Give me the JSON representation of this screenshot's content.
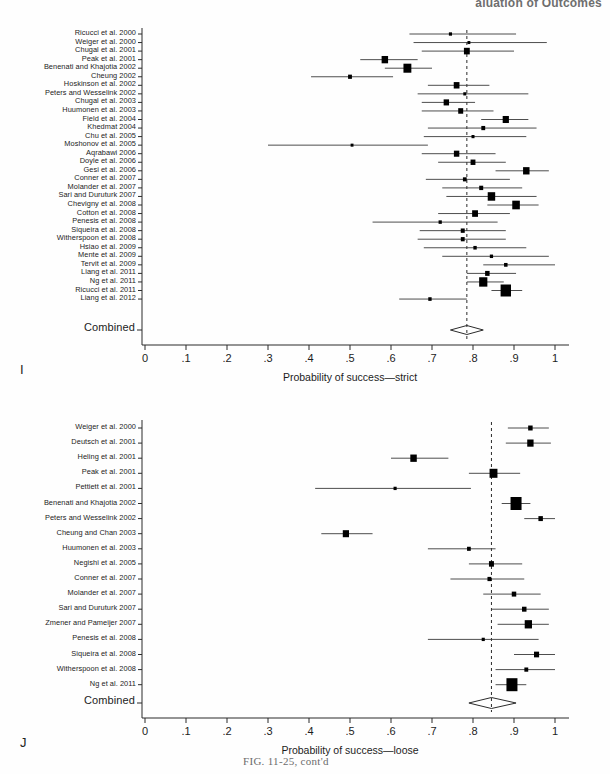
{
  "page": {
    "running_head": "aluation of Outcomes",
    "figure_caption": "FIG. 11-25, cont'd",
    "panel_I_letter": "I",
    "panel_J_letter": "J"
  },
  "axis": {
    "tick_labels": [
      "0",
      ".1",
      ".2",
      ".3",
      ".4",
      ".5",
      ".6",
      ".7",
      ".8",
      ".9",
      "1"
    ],
    "tick_values": [
      0,
      0.1,
      0.2,
      0.3,
      0.4,
      0.5,
      0.6,
      0.7,
      0.8,
      0.9,
      1.0
    ],
    "combined_row_label": "Combined"
  },
  "chart_data": [
    {
      "type": "forest",
      "panel": "I",
      "title": "",
      "xlabel": "Probability of success—strict",
      "ylabel": "",
      "xlim": [
        0,
        1
      ],
      "xticks": [
        0,
        0.1,
        0.2,
        0.3,
        0.4,
        0.5,
        0.6,
        0.7,
        0.8,
        0.9,
        1.0
      ],
      "xticklabels": [
        "0",
        ".1",
        ".2",
        ".3",
        ".4",
        ".5",
        ".6",
        ".7",
        ".8",
        ".9",
        "1"
      ],
      "grid": false,
      "reference_line": 0.785,
      "combined": {
        "label": "Combined",
        "estimate": 0.785,
        "ci_low": 0.745,
        "ci_high": 0.825
      },
      "studies": [
        {
          "label": "Ricucci et al. 2000",
          "estimate": 0.745,
          "ci_low": 0.645,
          "ci_high": 0.905,
          "weight": 0.18
        },
        {
          "label": "Weiger et al. 2000",
          "estimate": 0.79,
          "ci_low": 0.655,
          "ci_high": 0.98,
          "weight": 0.14
        },
        {
          "label": "Chugal et al. 2001",
          "estimate": 0.785,
          "ci_low": 0.675,
          "ci_high": 0.9,
          "weight": 0.62
        },
        {
          "label": "Peak et al. 2001",
          "estimate": 0.585,
          "ci_low": 0.525,
          "ci_high": 0.665,
          "weight": 0.72
        },
        {
          "label": "Benenati and Khajotia 2002",
          "estimate": 0.64,
          "ci_low": 0.585,
          "ci_high": 0.7,
          "weight": 0.95
        },
        {
          "label": "Cheung 2002",
          "estimate": 0.5,
          "ci_low": 0.405,
          "ci_high": 0.605,
          "weight": 0.3
        },
        {
          "label": "Hoskinson et al. 2002",
          "estimate": 0.76,
          "ci_low": 0.69,
          "ci_high": 0.84,
          "weight": 0.6
        },
        {
          "label": "Peters and Wesselink 2002",
          "estimate": 0.78,
          "ci_low": 0.665,
          "ci_high": 0.935,
          "weight": 0.16
        },
        {
          "label": "Chugal et al. 2003",
          "estimate": 0.735,
          "ci_low": 0.675,
          "ci_high": 0.805,
          "weight": 0.55
        },
        {
          "label": "Huumonen et al. 2003",
          "estimate": 0.77,
          "ci_low": 0.675,
          "ci_high": 0.85,
          "weight": 0.48
        },
        {
          "label": "Field et al. 2004",
          "estimate": 0.88,
          "ci_low": 0.82,
          "ci_high": 0.935,
          "weight": 0.68
        },
        {
          "label": "Khedmat 2004",
          "estimate": 0.825,
          "ci_low": 0.69,
          "ci_high": 0.955,
          "weight": 0.3
        },
        {
          "label": "Chu et al. 2005",
          "estimate": 0.8,
          "ci_low": 0.68,
          "ci_high": 0.93,
          "weight": 0.16
        },
        {
          "label": "Moshonov et al. 2005",
          "estimate": 0.505,
          "ci_low": 0.3,
          "ci_high": 0.69,
          "weight": 0.14
        },
        {
          "label": "Aqrabawi 2006",
          "estimate": 0.76,
          "ci_low": 0.675,
          "ci_high": 0.855,
          "weight": 0.55
        },
        {
          "label": "Doyle et al. 2006",
          "estimate": 0.8,
          "ci_low": 0.715,
          "ci_high": 0.88,
          "weight": 0.46
        },
        {
          "label": "Gesi et al. 2006",
          "estimate": 0.93,
          "ci_low": 0.855,
          "ci_high": 0.985,
          "weight": 0.72
        },
        {
          "label": "Conner et al. 2007",
          "estimate": 0.78,
          "ci_low": 0.685,
          "ci_high": 0.89,
          "weight": 0.28
        },
        {
          "label": "Molander et al. 2007",
          "estimate": 0.82,
          "ci_low": 0.725,
          "ci_high": 0.92,
          "weight": 0.32
        },
        {
          "label": "Sari and Duruturk 2007",
          "estimate": 0.845,
          "ci_low": 0.735,
          "ci_high": 0.955,
          "weight": 0.88
        },
        {
          "label": "Chevigny et al. 2008",
          "estimate": 0.905,
          "ci_low": 0.835,
          "ci_high": 0.96,
          "weight": 0.9
        },
        {
          "label": "Cotton et al. 2008",
          "estimate": 0.805,
          "ci_low": 0.715,
          "ci_high": 0.89,
          "weight": 0.62
        },
        {
          "label": "Penesis et al. 2008",
          "estimate": 0.72,
          "ci_low": 0.555,
          "ci_high": 0.86,
          "weight": 0.2
        },
        {
          "label": "Siqueira et al. 2008",
          "estimate": 0.775,
          "ci_low": 0.67,
          "ci_high": 0.88,
          "weight": 0.32
        },
        {
          "label": "Witherspoon et al. 2008",
          "estimate": 0.775,
          "ci_low": 0.665,
          "ci_high": 0.88,
          "weight": 0.3
        },
        {
          "label": "Hsiao et al. 2009",
          "estimate": 0.805,
          "ci_low": 0.68,
          "ci_high": 0.93,
          "weight": 0.22
        },
        {
          "label": "Mente et al. 2009",
          "estimate": 0.845,
          "ci_low": 0.725,
          "ci_high": 0.985,
          "weight": 0.2
        },
        {
          "label": "Tervit et al. 2009",
          "estimate": 0.88,
          "ci_low": 0.825,
          "ci_high": 1.0,
          "weight": 0.24
        },
        {
          "label": "Liang et al. 2011",
          "estimate": 0.835,
          "ci_low": 0.785,
          "ci_high": 0.905,
          "weight": 0.4
        },
        {
          "label": "Ng et al. 2011",
          "estimate": 0.825,
          "ci_low": 0.785,
          "ci_high": 0.875,
          "weight": 1.0
        },
        {
          "label": "Ricucci et al. 2011",
          "estimate": 0.88,
          "ci_low": 0.845,
          "ci_high": 0.92,
          "weight": 1.35
        },
        {
          "label": "Liang et al. 2012",
          "estimate": 0.695,
          "ci_low": 0.62,
          "ci_high": 0.785,
          "weight": 0.22
        }
      ]
    },
    {
      "type": "forest",
      "panel": "J",
      "title": "",
      "xlabel": "Probability of success—loose",
      "ylabel": "",
      "xlim": [
        0,
        1
      ],
      "xticks": [
        0,
        0.1,
        0.2,
        0.3,
        0.4,
        0.5,
        0.6,
        0.7,
        0.8,
        0.9,
        1.0
      ],
      "xticklabels": [
        "0",
        ".1",
        ".2",
        ".3",
        ".4",
        ".5",
        ".6",
        ".7",
        ".8",
        ".9",
        "1"
      ],
      "grid": false,
      "reference_line": 0.845,
      "combined": {
        "label": "Combined",
        "estimate": 0.845,
        "ci_low": 0.79,
        "ci_high": 0.905
      },
      "studies": [
        {
          "label": "Weiger et al. 2000",
          "estimate": 0.94,
          "ci_low": 0.885,
          "ci_high": 0.985,
          "weight": 0.4
        },
        {
          "label": "Deutsch et al. 2001",
          "estimate": 0.94,
          "ci_low": 0.88,
          "ci_high": 0.99,
          "weight": 0.7
        },
        {
          "label": "Heling et al. 2001",
          "estimate": 0.655,
          "ci_low": 0.6,
          "ci_high": 0.74,
          "weight": 0.72
        },
        {
          "label": "Peak et al. 2001",
          "estimate": 0.85,
          "ci_low": 0.79,
          "ci_high": 0.915,
          "weight": 0.95
        },
        {
          "label": "Pettiett et al. 2001",
          "estimate": 0.61,
          "ci_low": 0.415,
          "ci_high": 0.795,
          "weight": 0.18
        },
        {
          "label": "Benenati and Khajotia 2002",
          "estimate": 0.905,
          "ci_low": 0.87,
          "ci_high": 0.94,
          "weight": 1.85
        },
        {
          "label": "Peters and Wesselink 2002",
          "estimate": 0.965,
          "ci_low": 0.925,
          "ci_high": 1.0,
          "weight": 0.4
        },
        {
          "label": "Cheung and Chan 2003",
          "estimate": 0.49,
          "ci_low": 0.43,
          "ci_high": 0.555,
          "weight": 0.68
        },
        {
          "label": "Huumonen et al. 2003",
          "estimate": 0.79,
          "ci_low": 0.69,
          "ci_high": 0.855,
          "weight": 0.28
        },
        {
          "label": "Negishi et al. 2005",
          "estimate": 0.845,
          "ci_low": 0.79,
          "ci_high": 0.92,
          "weight": 0.48
        },
        {
          "label": "Conner et al. 2007",
          "estimate": 0.84,
          "ci_low": 0.745,
          "ci_high": 0.925,
          "weight": 0.3
        },
        {
          "label": "Molander et al. 2007",
          "estimate": 0.9,
          "ci_low": 0.825,
          "ci_high": 0.965,
          "weight": 0.4
        },
        {
          "label": "Sari and Duruturk 2007",
          "estimate": 0.925,
          "ci_low": 0.845,
          "ci_high": 0.985,
          "weight": 0.4
        },
        {
          "label": "Zmener and Pameijer 2007",
          "estimate": 0.935,
          "ci_low": 0.86,
          "ci_high": 0.985,
          "weight": 0.85
        },
        {
          "label": "Penesis et al. 2008",
          "estimate": 0.825,
          "ci_low": 0.69,
          "ci_high": 0.96,
          "weight": 0.18
        },
        {
          "label": "Siqueira et al. 2008",
          "estimate": 0.955,
          "ci_low": 0.9,
          "ci_high": 1.0,
          "weight": 0.5
        },
        {
          "label": "Witherspoon et al. 2008",
          "estimate": 0.93,
          "ci_low": 0.855,
          "ci_high": 1.0,
          "weight": 0.3
        },
        {
          "label": "Ng et al. 2011",
          "estimate": 0.895,
          "ci_low": 0.855,
          "ci_high": 0.93,
          "weight": 2.1
        }
      ]
    }
  ]
}
